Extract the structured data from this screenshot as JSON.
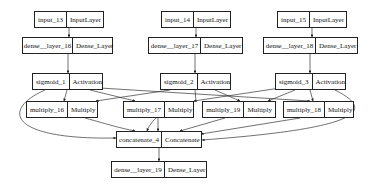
{
  "nodes": [
    {
      "id": "input_13",
      "name": "input_13",
      "type": "InputLayer",
      "x": 34,
      "y": 11,
      "w": 70,
      "split": 34
    },
    {
      "id": "input_14",
      "name": "input_14",
      "type": "InputLayer",
      "x": 161,
      "y": 11,
      "w": 70,
      "split": 34
    },
    {
      "id": "input_15",
      "name": "input_15",
      "type": "InputLayer",
      "x": 277,
      "y": 11,
      "w": 70,
      "split": 34
    },
    {
      "id": "dense_16",
      "name": "dense__layer_16",
      "type": "Dense_Layer",
      "x": 22,
      "y": 37,
      "w": 91,
      "split": 50
    },
    {
      "id": "dense_17",
      "name": "dense__layer_17",
      "type": "Dense_Layer",
      "x": 148,
      "y": 37,
      "w": 95,
      "split": 52
    },
    {
      "id": "dense_18",
      "name": "dense__layer_18",
      "type": "Dense_Layer",
      "x": 263,
      "y": 37,
      "w": 95,
      "split": 52
    },
    {
      "id": "sigmoid_1",
      "name": "sigmoid_1",
      "type": "Activation",
      "x": 32,
      "y": 73,
      "w": 71,
      "split": 37
    },
    {
      "id": "sigmoid_2",
      "name": "sigmoid_2",
      "type": "Activation",
      "x": 160,
      "y": 73,
      "w": 71,
      "split": 37
    },
    {
      "id": "sigmoid_3",
      "name": "sigmoid_3",
      "type": "Activation",
      "x": 275,
      "y": 73,
      "w": 71,
      "split": 37
    },
    {
      "id": "multiply_16",
      "name": "multiply_16",
      "type": "Multiply",
      "x": 26,
      "y": 101,
      "w": 72,
      "split": 41
    },
    {
      "id": "multiply_17",
      "name": "multiply_17",
      "type": "Multiply",
      "x": 123,
      "y": 101,
      "w": 71,
      "split": 41
    },
    {
      "id": "multiply_19",
      "name": "multiply_19",
      "type": "Multiply",
      "x": 202,
      "y": 101,
      "w": 74,
      "split": 43
    },
    {
      "id": "multiply_18",
      "name": "multiply_18",
      "type": "Multiply",
      "x": 283,
      "y": 101,
      "w": 71,
      "split": 41
    },
    {
      "id": "concatenate_4",
      "name": "concatenate_4",
      "type": "Concatenate",
      "x": 116,
      "y": 131,
      "w": 86,
      "split": 45
    },
    {
      "id": "dense_19",
      "name": "dense__layer_19",
      "type": "Dense_Layer",
      "x": 111,
      "y": 161,
      "w": 96,
      "split": 53
    }
  ],
  "edges": [
    {
      "from": "input_13",
      "to": "dense_16"
    },
    {
      "from": "input_14",
      "to": "dense_17"
    },
    {
      "from": "input_15",
      "to": "dense_18"
    },
    {
      "from": "dense_16",
      "to": "sigmoid_1"
    },
    {
      "from": "dense_17",
      "to": "sigmoid_2"
    },
    {
      "from": "dense_18",
      "to": "sigmoid_3"
    },
    {
      "from": "sigmoid_1",
      "to": "multiply_16"
    },
    {
      "from": "sigmoid_1",
      "to": "multiply_17"
    },
    {
      "from": "sigmoid_1",
      "to": "multiply_18"
    },
    {
      "from": "sigmoid_2",
      "to": "multiply_16"
    },
    {
      "from": "sigmoid_2",
      "to": "multiply_19"
    },
    {
      "from": "sigmoid_2",
      "to": "concatenate_4"
    },
    {
      "from": "sigmoid_3",
      "to": "multiply_17"
    },
    {
      "from": "sigmoid_3",
      "to": "multiply_19"
    },
    {
      "from": "sigmoid_3",
      "to": "multiply_18"
    },
    {
      "from": "sigmoid_1",
      "to": "concatenate_4"
    },
    {
      "from": "sigmoid_3",
      "to": "concatenate_4"
    },
    {
      "from": "multiply_16",
      "to": "concatenate_4"
    },
    {
      "from": "multiply_17",
      "to": "concatenate_4"
    },
    {
      "from": "multiply_19",
      "to": "concatenate_4"
    },
    {
      "from": "multiply_18",
      "to": "concatenate_4"
    },
    {
      "from": "concatenate_4",
      "to": "dense_19"
    }
  ],
  "colors": {
    "stroke": "#222222",
    "background": "#ffffff",
    "text": "#111111"
  }
}
